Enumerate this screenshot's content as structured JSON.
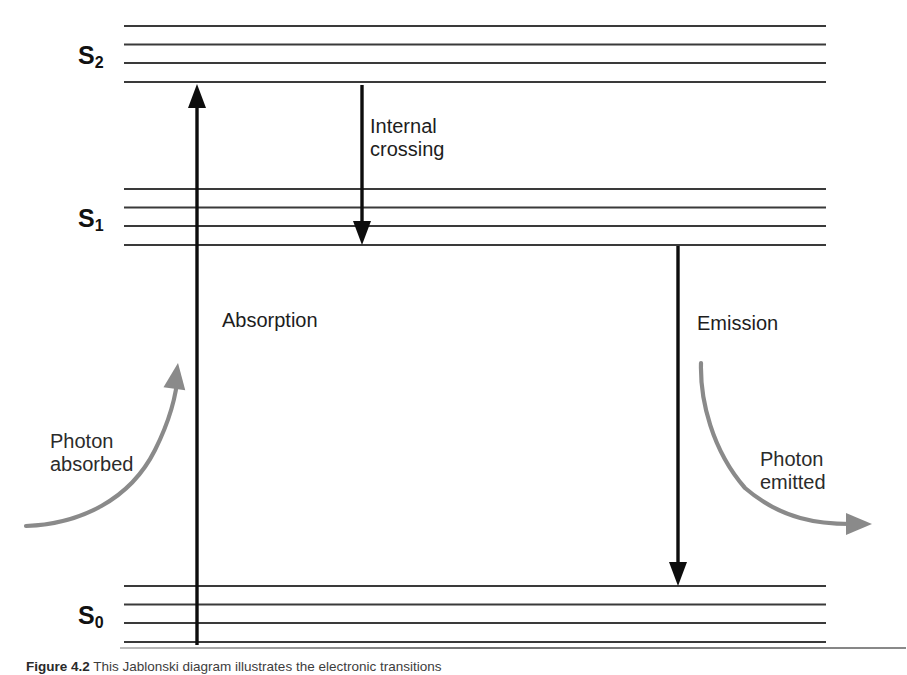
{
  "figure": {
    "kind": "jablonski-energy-level-diagram",
    "background_color": "#ffffff",
    "width": 907,
    "height": 671
  },
  "states": [
    {
      "id": "S2",
      "label_base": "S",
      "label_sub": "2",
      "label_x": 78,
      "label_y": 43,
      "n_levels": 4,
      "level_y": [
        26,
        44.5,
        63,
        82
      ]
    },
    {
      "id": "S1",
      "label_base": "S",
      "label_sub": "1",
      "label_x": 78,
      "label_y": 206,
      "n_levels": 4,
      "level_y": [
        189,
        207.5,
        226,
        245
      ]
    },
    {
      "id": "S0",
      "label_base": "S",
      "label_sub": "0",
      "label_x": 78,
      "label_y": 603,
      "n_levels": 4,
      "level_y": [
        586,
        604.5,
        623,
        642
      ]
    }
  ],
  "levels": {
    "x_start": 124,
    "x_end": 826,
    "color": "#3a3a3a",
    "stroke_width": 2.1
  },
  "transitions": [
    {
      "name": "absorption",
      "label": "Absorption",
      "label_x": 222,
      "label_y": 309,
      "x": 197,
      "y_from": 645,
      "y_to": 84,
      "direction": "up",
      "color": "#0d0d0d",
      "stroke_width": 3.4,
      "head_width": 18,
      "head_length": 24
    },
    {
      "name": "internal-crossing",
      "label_line1": "Internal",
      "label_line2": "crossing",
      "label_x": 370,
      "label_y": 115,
      "x": 362,
      "y_from": 85,
      "y_to": 245,
      "direction": "down",
      "color": "#0d0d0d",
      "stroke_width": 3.4,
      "head_width": 18,
      "head_length": 24
    },
    {
      "name": "emission",
      "label": "Emission",
      "label_x": 697,
      "label_y": 312,
      "x": 678,
      "y_from": 246,
      "y_to": 586,
      "direction": "down",
      "color": "#0d0d0d",
      "stroke_width": 3.4,
      "head_width": 18,
      "head_length": 24
    }
  ],
  "photons": [
    {
      "name": "photon-absorbed",
      "label_line1": "Photon",
      "label_line2": "absorbed",
      "label_x": 50,
      "label_y": 430,
      "color": "#8a8a8a",
      "stroke_width": 4.2,
      "path": "M 26 526 C 80 524 130 500 155 450 C 172 416 177 390 178 372",
      "arrow_tip_x": 178,
      "arrow_tip_y": 363,
      "arrow_angle_deg": -82,
      "head_width": 22,
      "head_length": 26
    },
    {
      "name": "photon-emitted",
      "label_line1": "Photon",
      "label_line2": "emitted",
      "label_x": 760,
      "label_y": 448,
      "color": "#8a8a8a",
      "stroke_width": 4.2,
      "path": "M 701 363 C 700 400 712 450 745 488 C 782 520 820 524 851 524",
      "arrow_tip_x": 872,
      "arrow_tip_y": 524,
      "arrow_angle_deg": 0,
      "head_width": 22,
      "head_length": 26
    }
  ],
  "caption": {
    "strong": "Figure 4.2",
    "text": "This Jablonski diagram illustrates the electronic transitions"
  }
}
